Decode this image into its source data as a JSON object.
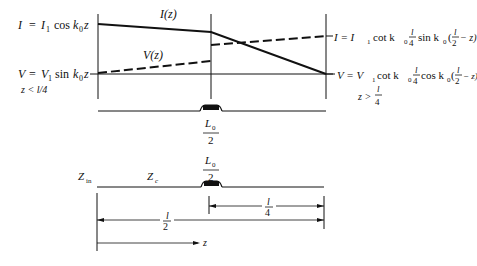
{
  "top_diagram": {
    "current_label": "I(z)",
    "voltage_label": "V(z)",
    "left_current_eq": {
      "lhs": "I",
      "rhs_a": "I",
      "rhs_a_sub": "1",
      "rhs_b": "cos",
      "rhs_c": "k",
      "rhs_c_sub": "0",
      "rhs_d": "z"
    },
    "left_voltage_eq": {
      "lhs": "V",
      "rhs_a": "V",
      "rhs_a_sub": "1",
      "rhs_b": "sin",
      "rhs_c": "k",
      "rhs_c_sub": "0",
      "rhs_d": "z"
    },
    "left_condition": "z < l/4",
    "right_current_eq": {
      "prefix": "I = I",
      "sub1": "1",
      "mid": "cot k",
      "sub0": "0",
      "frac_num": "l",
      "frac_den": "4",
      "fn": "sin k",
      "sub0b": "0",
      "paren_open": "(",
      "frac2_num": "l",
      "frac2_den": "2",
      "tail": "− z)"
    },
    "right_voltage_eq": {
      "prefix": "V = V",
      "sub1": "1",
      "mid": "cot k",
      "sub0": "0",
      "frac_num": "l",
      "frac_den": "4",
      "fn": "cos k",
      "sub0b": "0",
      "paren_open": "(",
      "frac2_num": "l",
      "frac2_den": "2",
      "tail": "− z)"
    },
    "right_condition": {
      "lhs": "z >",
      "num": "l",
      "den": "4"
    }
  },
  "middle_line": {
    "inductor_label": {
      "num": "L",
      "num_sub": "0",
      "den": "2"
    }
  },
  "bottom_diagram": {
    "zin_label": "Z",
    "zin_sub": "in",
    "zc_label": "Z",
    "zc_sub": "c",
    "inductor_label": {
      "num": "L",
      "num_sub": "0",
      "den": "2"
    },
    "quarter_dim": {
      "num": "l",
      "den": "4"
    },
    "half_dim": {
      "num": "l",
      "den": "2"
    },
    "z_axis_label": "z"
  }
}
